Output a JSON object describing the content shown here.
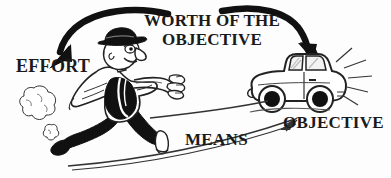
{
  "image": {
    "kind": "cartoon-diagram",
    "width": 391,
    "height": 178,
    "background_color": "#fdfdfd",
    "ink_color": "#1a1a1a",
    "style": "black and white line-art cartoon, bold serif capital labels"
  },
  "labels": {
    "effort": "EFFORT",
    "title_line1": "WORTH OF THE",
    "title_line2": "OBJECTIVE",
    "means": "MEANS",
    "objective": "OBJECTIVE"
  },
  "figures": {
    "runner": {
      "name": "running-businessman",
      "description": "cartoon man in fedora hat, white jacket, dark trousers and shoes, running to the right with both arms reaching forward toward the car",
      "dust_clouds": 2
    },
    "car": {
      "name": "cartoon-car",
      "description": "small cartoon automobile facing left with two black wheels, windshield and side window, shine lines radiating from the rear",
      "shine_lines": 5
    }
  },
  "arrows": {
    "effort_arrow": {
      "name": "worth-to-effort-arrow",
      "style": "thick-black-curved",
      "from": "WORTH OF THE OBJECTIVE",
      "to": "EFFORT",
      "direction": "left-and-down"
    },
    "objective_arrow": {
      "name": "worth-to-objective-arrow",
      "style": "thick-black-curved",
      "from": "WORTH OF THE OBJECTIVE",
      "to": "car / OBJECTIVE",
      "direction": "right-and-down"
    },
    "means_arrow": {
      "name": "means-arc-arrow",
      "style": "thin-line-curved",
      "from": "EFFORT (lower left)",
      "to": "OBJECTIVE (lower right)",
      "direction": "rightward-rising"
    },
    "means_connector": {
      "name": "means-connector-line",
      "style": "thin-line-curved",
      "from": "runner",
      "to": "car"
    }
  }
}
